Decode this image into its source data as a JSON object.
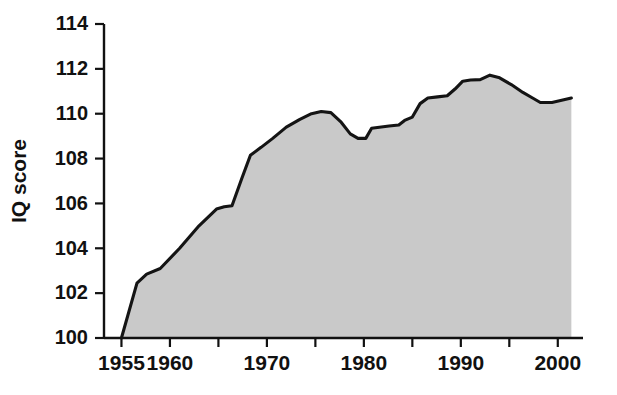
{
  "chart_data": {
    "type": "area",
    "title": "",
    "subtitle": "",
    "xlabel": "",
    "ylabel": "IQ score",
    "xlim": [
      1953.2,
      2002.6
    ],
    "ylim": [
      100,
      114
    ],
    "grid": false,
    "legend": null,
    "x_tick_labels": [
      "1955",
      "1960",
      "1970",
      "1980",
      "1990",
      "2000"
    ],
    "x_tick_values": [
      1955,
      1960,
      1970,
      1980,
      1990,
      2000
    ],
    "x_minor_tick_values": [
      1965,
      1975,
      1985,
      1995
    ],
    "y_tick_labels": [
      "100",
      "102",
      "104",
      "106",
      "108",
      "110",
      "112",
      "114"
    ],
    "y_tick_values": [
      100,
      102,
      104,
      106,
      108,
      110,
      112,
      114
    ],
    "series": [
      {
        "name": "IQ score",
        "fill_color": "#c9c9c9",
        "line_color": "#141414",
        "x": [
          1955.0,
          1956.6,
          1957.6,
          1959.0,
          1961.0,
          1963.0,
          1964.8,
          1965.6,
          1966.4,
          1967.4,
          1968.3,
          1969.4,
          1970.6,
          1972.0,
          1973.4,
          1974.6,
          1975.6,
          1976.6,
          1977.6,
          1978.6,
          1979.4,
          1980.2,
          1980.8,
          1981.6,
          1982.6,
          1983.6,
          1984.2,
          1985.0,
          1985.8,
          1986.6,
          1987.6,
          1988.6,
          1989.4,
          1990.2,
          1991.0,
          1992.0,
          1993.0,
          1994.0,
          1995.2,
          1996.4,
          1997.4,
          1998.2,
          1999.4,
          2000.4,
          2001.4
        ],
        "y": [
          100.0,
          102.45,
          102.85,
          103.1,
          104.0,
          105.0,
          105.75,
          105.85,
          105.9,
          107.1,
          108.15,
          108.5,
          108.9,
          109.4,
          109.75,
          110.0,
          110.1,
          110.05,
          109.65,
          109.1,
          108.9,
          108.9,
          109.35,
          109.4,
          109.45,
          109.5,
          109.7,
          109.85,
          110.45,
          110.7,
          110.75,
          110.8,
          111.1,
          111.45,
          111.5,
          111.52,
          111.72,
          111.6,
          111.3,
          110.95,
          110.7,
          110.5,
          110.5,
          110.6,
          110.7
        ]
      }
    ]
  },
  "axis": {
    "y_title": "IQ score"
  }
}
